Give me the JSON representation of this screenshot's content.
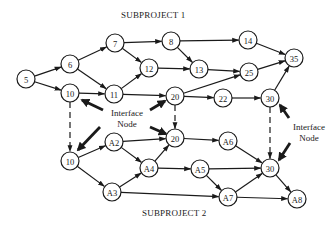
{
  "titles": {
    "subproject1": "SUBPROJECT 1",
    "subproject2": "SUBPROJECT 2"
  },
  "interface_labels": {
    "left_line1": "Interface",
    "left_line2": "Node",
    "right_line1": "Interface",
    "right_line2": "Node"
  },
  "colors": {
    "stroke": "#1a1a1a",
    "background": "#ffffff"
  },
  "nodes": [
    {
      "id": "n5",
      "label": "5",
      "x": 26,
      "y": 79,
      "group": "subproject1"
    },
    {
      "id": "n6",
      "label": "6",
      "x": 70,
      "y": 64,
      "group": "subproject1"
    },
    {
      "id": "n7",
      "label": "7",
      "x": 115,
      "y": 43,
      "group": "subproject1"
    },
    {
      "id": "n10a",
      "label": "10",
      "x": 70,
      "y": 93,
      "group": "subproject1"
    },
    {
      "id": "n11",
      "label": "11",
      "x": 114,
      "y": 94,
      "group": "subproject1"
    },
    {
      "id": "n12",
      "label": "12",
      "x": 149,
      "y": 68,
      "group": "subproject1"
    },
    {
      "id": "n8",
      "label": "8",
      "x": 171,
      "y": 41,
      "group": "subproject1"
    },
    {
      "id": "n13",
      "label": "13",
      "x": 199,
      "y": 69,
      "group": "subproject1"
    },
    {
      "id": "n14",
      "label": "14",
      "x": 248,
      "y": 40,
      "group": "subproject1"
    },
    {
      "id": "n25",
      "label": "25",
      "x": 249,
      "y": 72,
      "group": "subproject1"
    },
    {
      "id": "n35",
      "label": "35",
      "x": 294,
      "y": 58,
      "group": "subproject1"
    },
    {
      "id": "n20a",
      "label": "20",
      "x": 175,
      "y": 96,
      "group": "subproject1"
    },
    {
      "id": "n22",
      "label": "22",
      "x": 223,
      "y": 98,
      "group": "subproject1"
    },
    {
      "id": "n30a",
      "label": "30",
      "x": 270,
      "y": 98,
      "group": "subproject1"
    },
    {
      "id": "n10b",
      "label": "10",
      "x": 70,
      "y": 161,
      "group": "subproject2"
    },
    {
      "id": "nA2",
      "label": "A2",
      "x": 114,
      "y": 142,
      "group": "subproject2"
    },
    {
      "id": "nA3",
      "label": "A3",
      "x": 112,
      "y": 192,
      "group": "subproject2"
    },
    {
      "id": "nA4",
      "label": "A4",
      "x": 149,
      "y": 168,
      "group": "subproject2"
    },
    {
      "id": "n20b",
      "label": "20",
      "x": 175,
      "y": 138,
      "group": "subproject2"
    },
    {
      "id": "nA6",
      "label": "A6",
      "x": 228,
      "y": 141,
      "group": "subproject2"
    },
    {
      "id": "nA5",
      "label": "A5",
      "x": 200,
      "y": 169,
      "group": "subproject2"
    },
    {
      "id": "n30b",
      "label": "30",
      "x": 270,
      "y": 168,
      "group": "subproject2"
    },
    {
      "id": "nA7",
      "label": "A7",
      "x": 228,
      "y": 197,
      "group": "subproject2"
    },
    {
      "id": "nA8",
      "label": "A8",
      "x": 297,
      "y": 199,
      "group": "subproject2"
    }
  ],
  "edges": [
    {
      "from": "n5",
      "to": "n6"
    },
    {
      "from": "n5",
      "to": "n10a"
    },
    {
      "from": "n6",
      "to": "n7"
    },
    {
      "from": "n6",
      "to": "n11"
    },
    {
      "from": "n7",
      "to": "n8"
    },
    {
      "from": "n7",
      "to": "n12"
    },
    {
      "from": "n10a",
      "to": "n11"
    },
    {
      "from": "n11",
      "to": "n12"
    },
    {
      "from": "n11",
      "to": "n20a"
    },
    {
      "from": "n12",
      "to": "n13"
    },
    {
      "from": "n8",
      "to": "n14"
    },
    {
      "from": "n8",
      "to": "n13"
    },
    {
      "from": "n13",
      "to": "n25"
    },
    {
      "from": "n14",
      "to": "n35"
    },
    {
      "from": "n25",
      "to": "n35"
    },
    {
      "from": "n20a",
      "to": "n25"
    },
    {
      "from": "n20a",
      "to": "n22"
    },
    {
      "from": "n22",
      "to": "n30a"
    },
    {
      "from": "n30a",
      "to": "n35"
    },
    {
      "from": "n10b",
      "to": "nA2"
    },
    {
      "from": "n10b",
      "to": "nA3"
    },
    {
      "from": "nA2",
      "to": "n20b"
    },
    {
      "from": "nA2",
      "to": "nA4"
    },
    {
      "from": "nA3",
      "to": "nA4"
    },
    {
      "from": "nA4",
      "to": "n20b"
    },
    {
      "from": "nA4",
      "to": "nA5"
    },
    {
      "from": "n20b",
      "to": "nA6"
    },
    {
      "from": "nA6",
      "to": "n30b"
    },
    {
      "from": "nA5",
      "to": "n30b"
    },
    {
      "from": "nA5",
      "to": "nA7"
    },
    {
      "from": "nA3",
      "to": "nA7"
    },
    {
      "from": "nA7",
      "to": "n30b"
    },
    {
      "from": "nA7",
      "to": "nA8"
    },
    {
      "from": "n30b",
      "to": "nA8"
    }
  ],
  "interface_links": [
    {
      "from": "n10a",
      "to": "n10b"
    },
    {
      "from": "n20a",
      "to": "n20b"
    },
    {
      "from": "n30a",
      "to": "n30b"
    }
  ],
  "interface_pointers": [
    {
      "x1": 103,
      "y1": 110,
      "x2": 82,
      "y2": 100
    },
    {
      "x1": 150,
      "y1": 110,
      "x2": 165,
      "y2": 101
    },
    {
      "x1": 100,
      "y1": 127,
      "x2": 78,
      "y2": 150
    },
    {
      "x1": 150,
      "y1": 127,
      "x2": 166,
      "y2": 134
    },
    {
      "x1": 289,
      "y1": 118,
      "x2": 280,
      "y2": 105
    },
    {
      "x1": 290,
      "y1": 143,
      "x2": 279,
      "y2": 160
    }
  ]
}
